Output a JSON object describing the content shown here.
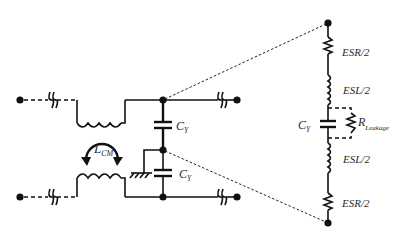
{
  "diagram": {
    "type": "circuit-schematic",
    "colors": {
      "line": "#111111",
      "label": "#2a2a2a",
      "background": "#ffffff"
    },
    "labels": {
      "lcm_main": "L",
      "lcm_sub": "CM",
      "cy_top_main": "C",
      "cy_top_sub": "Y",
      "cy_bottom_main": "C",
      "cy_bottom_sub": "Y",
      "cy_eq_main": "C",
      "cy_eq_sub": "Y",
      "esr_top": "ESR/2",
      "esl_top": "ESL/2",
      "rleak_main": "R",
      "rleak_sub": "Leakage",
      "esl_bottom": "ESL/2",
      "esr_bottom": "ESR/2"
    },
    "components": [
      {
        "id": "LCM",
        "kind": "coupled-inductor",
        "label": "L_CM"
      },
      {
        "id": "CY1",
        "kind": "capacitor",
        "label": "C_Y"
      },
      {
        "id": "CY2",
        "kind": "capacitor",
        "label": "C_Y"
      },
      {
        "id": "ground",
        "kind": "chassis-ground"
      },
      {
        "id": "ESR_top",
        "kind": "resistor",
        "label": "ESR/2"
      },
      {
        "id": "ESL_top",
        "kind": "inductor",
        "label": "ESL/2"
      },
      {
        "id": "CY_eq",
        "kind": "capacitor",
        "label": "C_Y"
      },
      {
        "id": "R_leak",
        "kind": "resistor",
        "label": "R_Leakage"
      },
      {
        "id": "ESL_bottom",
        "kind": "inductor",
        "label": "ESL/2"
      },
      {
        "id": "ESR_bottom",
        "kind": "resistor",
        "label": "ESR/2"
      }
    ]
  }
}
